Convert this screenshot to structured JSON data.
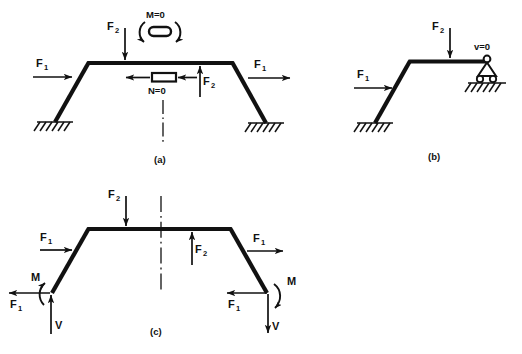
{
  "figure": {
    "background": "#ffffff",
    "ink": "#111111",
    "panels": [
      {
        "id": "a",
        "caption": "(a)",
        "description": "Symmetric portal frame on two fixed supports with release symbols for moment and normal force on the symmetry axis",
        "labels": {
          "moment_release": "M=0",
          "normal_release": "N=0",
          "force_left": "F",
          "force_left_sub": "1",
          "force_right": "F",
          "force_right_sub": "1",
          "force_top": "F",
          "force_top_sub": "2",
          "force_inner": "F",
          "force_inner_sub": "2"
        }
      },
      {
        "id": "b",
        "caption": "(b)",
        "description": "Half frame with fixed support at left base and pinned roller support at right end",
        "labels": {
          "support_condition": "v=0",
          "force_left": "F",
          "force_left_sub": "1",
          "force_top": "F",
          "force_top_sub": "2"
        }
      },
      {
        "id": "c",
        "caption": "(c)",
        "description": "Free-body diagram of the frame with support reactions F1, V and M at both bases",
        "labels": {
          "force_left": "F",
          "force_left_sub": "1",
          "force_right": "F",
          "force_right_sub": "1",
          "force_top": "F",
          "force_top_sub": "2",
          "force_inner": "F",
          "force_inner_sub": "2",
          "reaction_left_force": "F",
          "reaction_left_force_sub": "1",
          "reaction_left_shear": "V",
          "reaction_left_moment": "M",
          "reaction_right_force": "F",
          "reaction_right_force_sub": "1",
          "reaction_right_shear": "V",
          "reaction_right_moment": "M"
        }
      }
    ]
  }
}
